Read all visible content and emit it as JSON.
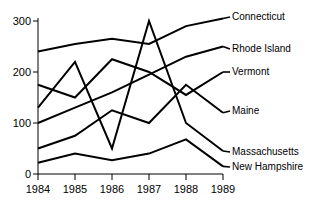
{
  "chart_data": {
    "type": "line",
    "title": "",
    "xlabel": "",
    "ylabel": "",
    "x": [
      "1984",
      "1985",
      "1986",
      "1987",
      "1988",
      "1989"
    ],
    "categories": [
      "1984",
      "1985",
      "1986",
      "1987",
      "1988",
      "1989"
    ],
    "xlim": [
      1984,
      1989
    ],
    "ylim": [
      0,
      300
    ],
    "yticks": [
      "0",
      "100",
      "200",
      "300"
    ],
    "ytick_values": [
      0,
      100,
      200,
      300
    ],
    "grid": false,
    "legend_position": "right-inline-labels",
    "series": [
      {
        "name": "Connecticut",
        "values": [
          240,
          255,
          265,
          255,
          290,
          305
        ]
      },
      {
        "name": "Rhode Island",
        "values": [
          100,
          130,
          160,
          195,
          230,
          250
        ]
      },
      {
        "name": "Vermont",
        "values": [
          175,
          150,
          225,
          200,
          155,
          200
        ]
      },
      {
        "name": "Maine",
        "values": [
          50,
          75,
          125,
          100,
          175,
          120
        ]
      },
      {
        "name": "Massachusetts",
        "values": [
          130,
          220,
          50,
          300,
          100,
          45
        ]
      },
      {
        "name": "New Hampshire",
        "values": [
          22,
          40,
          27,
          40,
          68,
          15
        ]
      }
    ]
  },
  "axis": {
    "y_tick_0": "0",
    "y_tick_100": "100",
    "y_tick_200": "200",
    "y_tick_300": "300",
    "x_tick_1984": "1984",
    "x_tick_1985": "1985",
    "x_tick_1986": "1986",
    "x_tick_1987": "1987",
    "x_tick_1988": "1988",
    "x_tick_1989": "1989"
  },
  "labels": {
    "connecticut": "Connecticut",
    "rhode_island": "Rhode Island",
    "vermont": "Vermont",
    "maine": "Maine",
    "massachusetts": "Massachusetts",
    "new_hampshire": "New Hampshire"
  },
  "colors": {
    "line": "#000000",
    "axis": "#000000",
    "background": "#ffffff"
  }
}
